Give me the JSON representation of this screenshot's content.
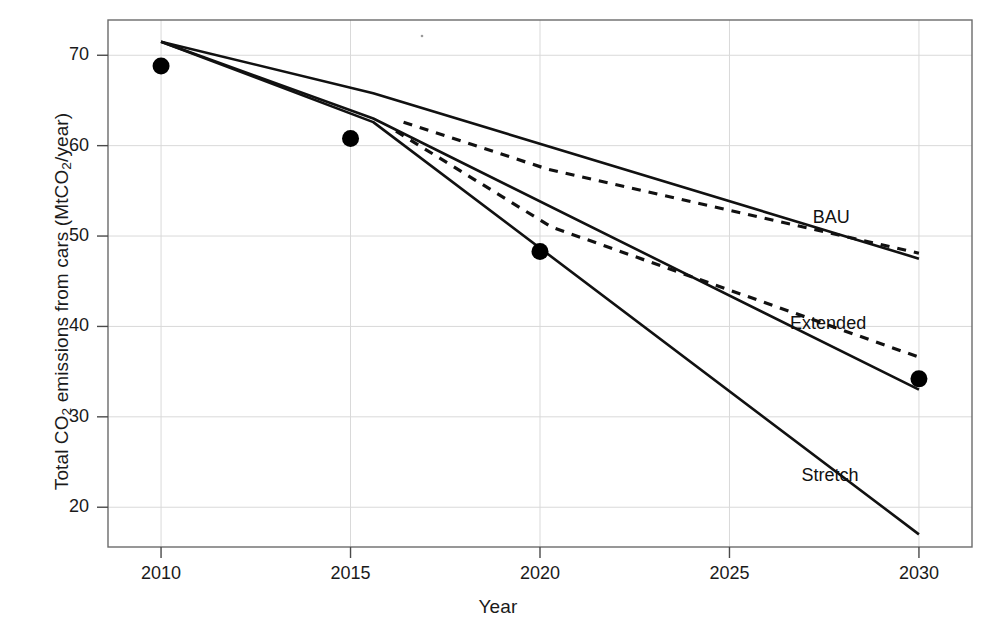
{
  "chart_data": {
    "type": "line",
    "title": "",
    "xlabel": "Year",
    "ylabel_parts": {
      "pre": "Total CO",
      "sub1": "2",
      "mid": " emissions from cars (MtCO",
      "sub2": "2",
      "post": "/year)"
    },
    "ylabel": "Total CO2 emissions from cars (MtCO2/year)",
    "xlim": [
      2008.6,
      2031.4
    ],
    "ylim": [
      15.6,
      73.9
    ],
    "xticks": [
      2010,
      2015,
      2020,
      2025,
      2030
    ],
    "xtick_labels": [
      "2010",
      "2015",
      "2020",
      "2025",
      "2030"
    ],
    "yticks": [
      20,
      30,
      40,
      50,
      60,
      70
    ],
    "ytick_labels": [
      "20",
      "30",
      "40",
      "50",
      "60",
      "70"
    ],
    "grid": true,
    "grid_color": "#d9d9d9",
    "legend_position": "inline-right",
    "line_color": "#111111",
    "marker_color": "#000000",
    "observed_points": {
      "name": "Observed",
      "marker": "filled-circle",
      "x": [
        2010,
        2015,
        2020,
        2030
      ],
      "y": [
        68.8,
        60.8,
        48.3,
        34.2
      ]
    },
    "series": [
      {
        "name": "BAU",
        "label": "BAU",
        "style": "solid",
        "x": [
          2010,
          2015.6,
          2030
        ],
        "y": [
          71.5,
          65.8,
          47.5
        ],
        "label_x": 2027.2,
        "label_y": 52.0
      },
      {
        "name": "BAU-dashed",
        "label": "",
        "style": "dashed",
        "x": [
          2016.4,
          2020.2,
          2030
        ],
        "y": [
          62.6,
          57.4,
          48.1
        ],
        "label_x": null,
        "label_y": null
      },
      {
        "name": "Extended",
        "label": "Extended",
        "style": "solid",
        "x": [
          2010,
          2015.6,
          2030
        ],
        "y": [
          71.5,
          63.0,
          33.0
        ],
        "label_x": 2026.6,
        "label_y": 40.3
      },
      {
        "name": "Extended-dashed",
        "label": "",
        "style": "dashed",
        "x": [
          2016.2,
          2020.3,
          2030
        ],
        "y": [
          61.6,
          51.0,
          36.6
        ],
        "label_x": null,
        "label_y": null
      },
      {
        "name": "Stretch",
        "label": "Stretch",
        "style": "solid",
        "x": [
          2010,
          2015.6,
          2030
        ],
        "y": [
          71.5,
          62.6,
          17.0
        ],
        "label_x": 2026.9,
        "label_y": 23.4
      }
    ]
  }
}
